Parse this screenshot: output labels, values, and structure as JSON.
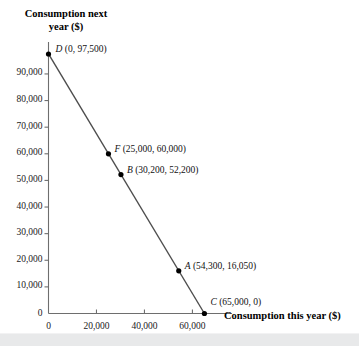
{
  "figure": {
    "top_fragment": "and the or.",
    "bottom_band_color": "#e8e9ea"
  },
  "chart_data": {
    "type": "line",
    "title": "",
    "subtitle": "",
    "xlabel": "Consumption this year ($)",
    "ylabel": "Consumption next year ($)",
    "xlim": [
      0,
      76500
    ],
    "ylim": [
      0,
      102000
    ],
    "grid": false,
    "legend": "none",
    "series": [
      {
        "name": "Budget line",
        "color": "#4d4d4d",
        "x": [
          0,
          65000
        ],
        "y": [
          97500,
          0
        ]
      }
    ],
    "points": [
      {
        "label": "D",
        "x": 0,
        "y": 97500,
        "annotation": "D (0, 97,500)",
        "label_dx": 7,
        "label_dy": -5
      },
      {
        "label": "F",
        "x": 25000,
        "y": 60000,
        "annotation": "F (25,000, 60,000)",
        "label_dx": 6,
        "label_dy": -5
      },
      {
        "label": "B",
        "x": 30200,
        "y": 52200,
        "annotation": "B (30,200, 52,200)",
        "label_dx": 6,
        "label_dy": -5
      },
      {
        "label": "A",
        "x": 54300,
        "y": 16050,
        "annotation": "A (54,300, 16,050)",
        "label_dx": 6,
        "label_dy": -5
      },
      {
        "label": "C",
        "x": 65000,
        "y": 0,
        "annotation": "C (65,000, 0)",
        "label_dx": 6,
        "label_dy": -12
      }
    ],
    "xticks": [
      0,
      20000,
      40000,
      60000
    ],
    "xtick_labels": [
      "0",
      "20,000",
      "40,000",
      "60,000"
    ],
    "yticks": [
      0,
      10000,
      20000,
      30000,
      40000,
      50000,
      60000,
      70000,
      80000,
      90000
    ],
    "ytick_labels": [
      "0",
      "10,000",
      "20,000",
      "30,000",
      "40,000",
      "50,000",
      "60,000",
      "70,000",
      "80,000",
      "90,000"
    ],
    "axis_color": "#6e6e6e",
    "point_color": "#000000"
  }
}
